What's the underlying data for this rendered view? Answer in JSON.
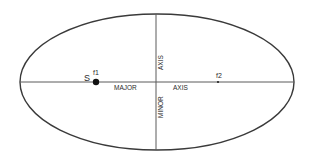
{
  "diagram": {
    "type": "ellipse",
    "labels": {
      "sun": "S",
      "focus1": "f1",
      "focus2": "f2",
      "major_word": "MAJOR",
      "major_axis_word": "AXIS",
      "minor_word": "MINOR",
      "minor_axis_word": "AXIS"
    },
    "colors": {
      "stroke": "#3a3a3a",
      "axis": "#5a5a5a",
      "text": "#2a2a2a"
    }
  }
}
